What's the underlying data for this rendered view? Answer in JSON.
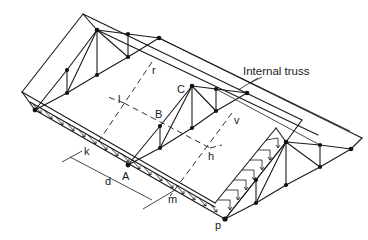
{
  "figure": {
    "annotation": "Internal truss",
    "labels": {
      "A": "A",
      "B": "B",
      "C": "C",
      "d": "d",
      "h": "h",
      "k": "k",
      "l": "l",
      "m": "m",
      "p": "p",
      "r": "r",
      "v": "v"
    },
    "colors": {
      "line": "#1a1a1a",
      "node": "#111111",
      "background": "#ffffff"
    }
  }
}
